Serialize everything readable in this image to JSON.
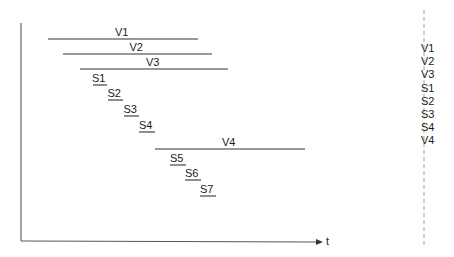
{
  "axis": {
    "x_label": "t"
  },
  "bars": [
    {
      "label": "V1",
      "x1": 48,
      "x2": 198,
      "y": 39,
      "underline_only": false
    },
    {
      "label": "V2",
      "x1": 63,
      "x2": 212,
      "y": 54,
      "underline_only": false
    },
    {
      "label": "V3",
      "x1": 80,
      "x2": 228,
      "y": 69,
      "underline_only": false
    },
    {
      "label": "S1",
      "x1": 93,
      "x2": 107,
      "y": 85,
      "underline_only": true
    },
    {
      "label": "S2",
      "x1": 108,
      "x2": 123,
      "y": 100,
      "underline_only": true
    },
    {
      "label": "S3",
      "x1": 124,
      "x2": 139,
      "y": 116,
      "underline_only": true
    },
    {
      "label": "S4",
      "x1": 139,
      "x2": 155,
      "y": 132,
      "underline_only": true
    },
    {
      "label": "V4",
      "x1": 155,
      "x2": 305,
      "y": 149,
      "underline_only": false
    },
    {
      "label": "S5",
      "x1": 170,
      "x2": 186,
      "y": 165,
      "underline_only": true
    },
    {
      "label": "S6",
      "x1": 185,
      "x2": 201,
      "y": 180,
      "underline_only": true
    },
    {
      "label": "S7",
      "x1": 200,
      "x2": 216,
      "y": 196,
      "underline_only": true
    }
  ],
  "legend": [
    "V1",
    "V2",
    "V3",
    "S1",
    "S2",
    "S3",
    "S4",
    "V4"
  ]
}
